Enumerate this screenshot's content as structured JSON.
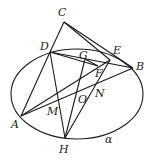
{
  "figure": {
    "plane_label": "α",
    "points": {
      "C": {
        "label": "C",
        "x": 64,
        "y": 22,
        "lx": 58,
        "ly": 16
      },
      "D": {
        "label": "D",
        "x": 50,
        "y": 52,
        "lx": 40,
        "ly": 50
      },
      "E": {
        "label": "E",
        "x": 110,
        "y": 60,
        "lx": 113,
        "ly": 54
      },
      "B": {
        "label": "B",
        "x": 133,
        "y": 68,
        "lx": 136,
        "ly": 70
      },
      "G": {
        "label": "G",
        "x": 85,
        "y": 59,
        "lx": 79,
        "ly": 59
      },
      "F": {
        "label": "F",
        "x": 98,
        "y": 66,
        "lx": 95,
        "ly": 77
      },
      "A": {
        "label": "A",
        "x": 21,
        "y": 116,
        "lx": 11,
        "ly": 128
      },
      "H": {
        "label": "H",
        "x": 65,
        "y": 138,
        "lx": 59,
        "ly": 153
      },
      "M": {
        "label": "M",
        "x": 57,
        "y": 107,
        "lx": 47,
        "ly": 115
      },
      "O": {
        "label": "O",
        "x": 80,
        "y": 99,
        "lx": 78,
        "ly": 103
      },
      "N": {
        "label": "N",
        "x": 93,
        "y": 95,
        "lx": 95,
        "ly": 97
      }
    }
  }
}
